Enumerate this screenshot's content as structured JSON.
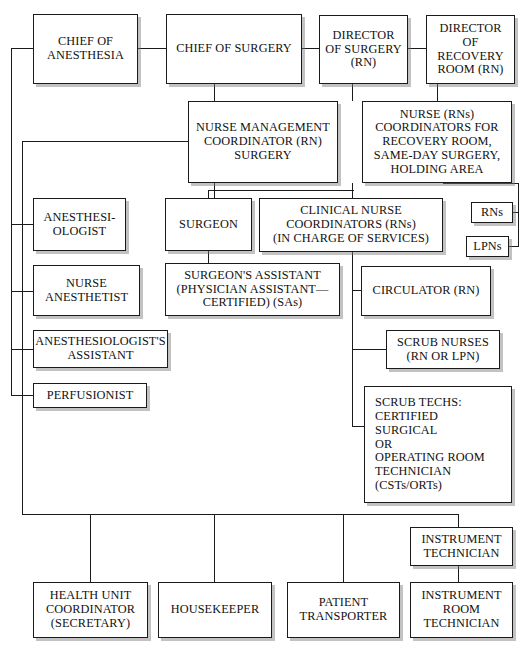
{
  "chart_title": "Surgical Department Organizational Chart",
  "nodes": {
    "chief_of_anesthesia": "CHIEF OF\nANESTHESIA",
    "chief_of_surgery": "CHIEF OF SURGERY",
    "director_of_surgery": "DIRECTOR\nOF SURGERY\n(RN)",
    "director_of_recovery_room": "DIRECTOR\nOF\nRECOVERY\nROOM (RN)",
    "nurse_management_coordinator": "NURSE MANAGEMENT\nCOORDINATOR (RN)\nSURGERY",
    "nurse_coordinators_recovery": "NURSE (RNs)\nCOORDINATORS FOR\nRECOVERY ROOM,\nSAME-DAY SURGERY,\nHOLDING AREA",
    "anesthesiologist": "ANESTHESI-\nOLOGIST",
    "surgeon": "SURGEON",
    "clinical_nurse_coordinators": "CLINICAL NURSE\nCOORDINATORS (RNs)\n(IN CHARGE OF SERVICES)",
    "rns": "RNs",
    "lpns": "LPNs",
    "nurse_anesthetist": "NURSE\nANESTHETIST",
    "surgeons_assistant": "SURGEON'S ASSISTANT\n(PHYSICIAN ASSISTANT—\nCERTIFIED) (SAs)",
    "circulator": "CIRCULATOR (RN)",
    "anesthesiologists_assistant": "ANESTHESIOLOGIST'S\nASSISTANT",
    "scrub_nurses": "SCRUB NURSES\n(RN OR LPN)",
    "perfusionist": "PERFUSIONIST",
    "scrub_techs": "SCRUB TECHS:\n   CERTIFIED\n   SURGICAL\n   OR\n   OPERATING ROOM\n   TECHNICIAN\n   (CSTs/ORTs)",
    "instrument_technician": "INSTRUMENT\nTECHNICIAN",
    "health_unit_coordinator": "HEALTH UNIT\nCOORDINATOR\n(SECRETARY)",
    "housekeeper": "HOUSEKEEPER",
    "patient_transporter": "PATIENT\nTRANSPORTER",
    "instrument_room_technician": "INSTRUMENT\nROOM\nTECHNICIAN"
  },
  "colors": {
    "box_border": "#1b1b1b",
    "box_fill": "#ffffff",
    "connector": "#1b1b1b",
    "shadow": "#787878",
    "text": "#111111",
    "background": "#ffffff"
  }
}
